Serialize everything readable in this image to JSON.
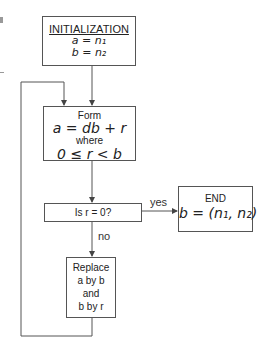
{
  "diagram": {
    "type": "flowchart",
    "nodes": {
      "init": {
        "heading": "INITIALIZATION",
        "line1": "a = n₁",
        "line2": "b = n₂"
      },
      "form": {
        "line1": "Form",
        "line2": "a = db + r",
        "line3": "where",
        "line4": "0 ≤ r < b"
      },
      "decision": {
        "text": "Is r = 0?"
      },
      "end": {
        "heading": "END",
        "line1": "b = (n₁, n₂)"
      },
      "replace": {
        "line1": "Replace",
        "line2": "a by b",
        "line3": "and",
        "line4": "b by r"
      }
    },
    "edges": {
      "yes_label": "yes",
      "no_label": "no"
    },
    "colors": {
      "line": "#555555",
      "text": "#222222",
      "background": "#ffffff"
    }
  }
}
